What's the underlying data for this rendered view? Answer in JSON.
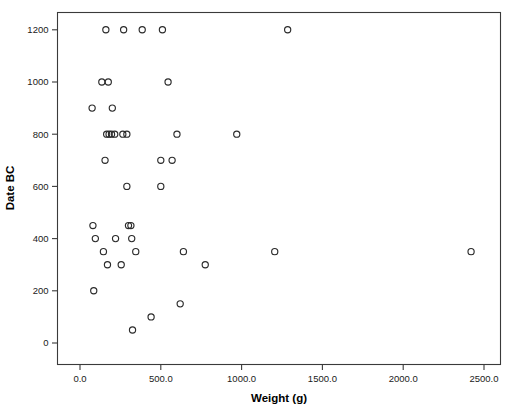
{
  "chart_data": {
    "type": "scatter",
    "title": "",
    "xlabel": "Weight (g)",
    "ylabel": "Date BC",
    "xlim": [
      -150,
      2620
    ],
    "ylim": [
      -60,
      1285
    ],
    "grid": false,
    "legend": null,
    "xticks": [
      0,
      500,
      1000,
      1500,
      2000,
      2500
    ],
    "xtick_labels": [
      "0.0",
      "500.0",
      "1000.0",
      "1500.0",
      "2000.0",
      "2500.0"
    ],
    "yticks": [
      0,
      200,
      400,
      600,
      800,
      1000,
      1200
    ],
    "ytick_labels": [
      "0",
      "200",
      "400",
      "600",
      "800",
      "1000",
      "1200"
    ],
    "marker": "open-circle",
    "marker_color": "#2b2b2b",
    "points": [
      {
        "x": 160,
        "y": 1200
      },
      {
        "x": 270,
        "y": 1200
      },
      {
        "x": 385,
        "y": 1200
      },
      {
        "x": 510,
        "y": 1200
      },
      {
        "x": 1285,
        "y": 1200
      },
      {
        "x": 135,
        "y": 1000
      },
      {
        "x": 175,
        "y": 1000
      },
      {
        "x": 545,
        "y": 1000
      },
      {
        "x": 75,
        "y": 900
      },
      {
        "x": 200,
        "y": 900
      },
      {
        "x": 165,
        "y": 800
      },
      {
        "x": 180,
        "y": 800
      },
      {
        "x": 195,
        "y": 800
      },
      {
        "x": 215,
        "y": 800
      },
      {
        "x": 265,
        "y": 800
      },
      {
        "x": 290,
        "y": 800
      },
      {
        "x": 600,
        "y": 800
      },
      {
        "x": 970,
        "y": 800
      },
      {
        "x": 155,
        "y": 700
      },
      {
        "x": 500,
        "y": 700
      },
      {
        "x": 570,
        "y": 700
      },
      {
        "x": 290,
        "y": 600
      },
      {
        "x": 500,
        "y": 600
      },
      {
        "x": 80,
        "y": 450
      },
      {
        "x": 300,
        "y": 450
      },
      {
        "x": 315,
        "y": 450
      },
      {
        "x": 95,
        "y": 400
      },
      {
        "x": 220,
        "y": 400
      },
      {
        "x": 320,
        "y": 400
      },
      {
        "x": 145,
        "y": 350
      },
      {
        "x": 345,
        "y": 350
      },
      {
        "x": 640,
        "y": 350
      },
      {
        "x": 1205,
        "y": 350
      },
      {
        "x": 2420,
        "y": 350
      },
      {
        "x": 170,
        "y": 300
      },
      {
        "x": 255,
        "y": 300
      },
      {
        "x": 775,
        "y": 300
      },
      {
        "x": 85,
        "y": 200
      },
      {
        "x": 620,
        "y": 150
      },
      {
        "x": 440,
        "y": 100
      },
      {
        "x": 325,
        "y": 50
      }
    ]
  }
}
